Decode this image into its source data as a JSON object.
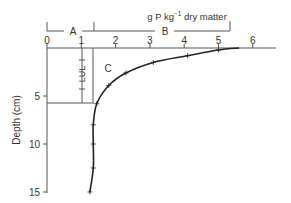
{
  "chart_data": {
    "type": "line",
    "title": "",
    "xlabel": "g P kg⁻¹ dry matter",
    "ylabel": "Depth (cm)",
    "xlim": [
      0,
      6.7
    ],
    "ylim": [
      0,
      15
    ],
    "y_inverted": true,
    "x_ticks": [
      "0",
      "1",
      "2",
      "3",
      "4",
      "5",
      "6"
    ],
    "y_ticks": [
      "5",
      "10",
      "15"
    ],
    "grid": false,
    "series": [
      {
        "name": "P concentration profile",
        "x": [
          5.6,
          5.0,
          4.1,
          3.1,
          2.3,
          1.8,
          1.45,
          1.35,
          1.35,
          1.35,
          1.25
        ],
        "y": [
          0,
          0.2,
          0.8,
          1.5,
          2.6,
          3.9,
          5.8,
          8.0,
          10.0,
          12.5,
          15.0
        ]
      }
    ],
    "annotations": {
      "bracket_A": {
        "label": "A",
        "x_range": [
          0,
          1.35
        ]
      },
      "bracket_B": {
        "label": "B",
        "x_range": [
          1.35,
          5.4
        ]
      },
      "region_C": {
        "label": "C"
      },
      "lul": {
        "label": "LUL",
        "x_range": [
          1.0,
          1.35
        ],
        "depth_range": [
          0,
          5.8
        ]
      }
    }
  }
}
